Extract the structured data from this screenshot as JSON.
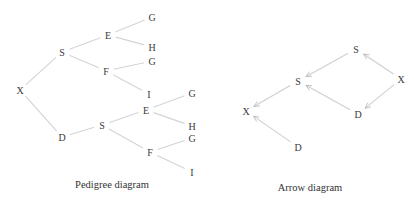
{
  "colors": {
    "edge": "#d4d4d4",
    "text": "#3a3a3a",
    "background": "#ffffff"
  },
  "pedigree": {
    "caption": "Pedigree diagram",
    "nodes": [
      {
        "id": "p_x",
        "label": "X",
        "x": 20,
        "y": 90
      },
      {
        "id": "p_s1",
        "label": "S",
        "x": 62,
        "y": 52
      },
      {
        "id": "p_e1",
        "label": "E",
        "x": 108,
        "y": 35
      },
      {
        "id": "p_g1",
        "label": "G",
        "x": 152,
        "y": 17
      },
      {
        "id": "p_h1",
        "label": "H",
        "x": 152,
        "y": 47
      },
      {
        "id": "p_f1",
        "label": "F",
        "x": 106,
        "y": 71
      },
      {
        "id": "p_g2",
        "label": "G",
        "x": 152,
        "y": 61
      },
      {
        "id": "p_i1",
        "label": "I",
        "x": 149,
        "y": 94
      },
      {
        "id": "p_d",
        "label": "D",
        "x": 62,
        "y": 137
      },
      {
        "id": "p_s2",
        "label": "S",
        "x": 102,
        "y": 125
      },
      {
        "id": "p_e2",
        "label": "E",
        "x": 146,
        "y": 110
      },
      {
        "id": "p_g3",
        "label": "G",
        "x": 192,
        "y": 93
      },
      {
        "id": "p_h2",
        "label": "H",
        "x": 192,
        "y": 126
      },
      {
        "id": "p_f2",
        "label": "F",
        "x": 150,
        "y": 152
      },
      {
        "id": "p_g4",
        "label": "G",
        "x": 192,
        "y": 138
      },
      {
        "id": "p_i2",
        "label": "I",
        "x": 192,
        "y": 172
      }
    ],
    "edges": [
      [
        "p_x",
        "p_s1"
      ],
      [
        "p_x",
        "p_d"
      ],
      [
        "p_s1",
        "p_e1"
      ],
      [
        "p_s1",
        "p_f1"
      ],
      [
        "p_e1",
        "p_g1"
      ],
      [
        "p_e1",
        "p_h1"
      ],
      [
        "p_f1",
        "p_g2"
      ],
      [
        "p_f1",
        "p_i1"
      ],
      [
        "p_d",
        "p_s2"
      ],
      [
        "p_s2",
        "p_e2"
      ],
      [
        "p_s2",
        "p_f2"
      ],
      [
        "p_e2",
        "p_g3"
      ],
      [
        "p_e2",
        "p_h2"
      ],
      [
        "p_f2",
        "p_g4"
      ],
      [
        "p_f2",
        "p_i2"
      ]
    ]
  },
  "arrow": {
    "caption": "Arrow diagram",
    "nodes": [
      {
        "id": "a_s_top",
        "label": "S",
        "x": 356,
        "y": 49
      },
      {
        "id": "a_x_right",
        "label": "X",
        "x": 401,
        "y": 79
      },
      {
        "id": "a_s_mid",
        "label": "S",
        "x": 298,
        "y": 81
      },
      {
        "id": "a_d_right",
        "label": "D",
        "x": 358,
        "y": 114
      },
      {
        "id": "a_x_left",
        "label": "X",
        "x": 246,
        "y": 111
      },
      {
        "id": "a_d_bottom",
        "label": "D",
        "x": 298,
        "y": 147
      }
    ],
    "arrows": [
      {
        "from": "a_x_right",
        "to": "a_s_top"
      },
      {
        "from": "a_x_right",
        "to": "a_d_right"
      },
      {
        "from": "a_s_top",
        "to": "a_s_mid"
      },
      {
        "from": "a_d_right",
        "to": "a_s_mid"
      },
      {
        "from": "a_s_mid",
        "to": "a_x_left"
      },
      {
        "from": "a_d_bottom",
        "to": "a_x_left"
      }
    ]
  },
  "captions": {
    "pedigree": {
      "text": "Pedigree diagram",
      "x": 112,
      "y": 184
    },
    "arrow": {
      "text": "Arrow diagram",
      "x": 310,
      "y": 187
    }
  }
}
